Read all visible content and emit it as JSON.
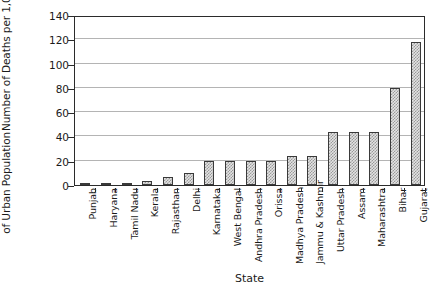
{
  "chart_data": {
    "type": "bar",
    "title": "",
    "xlabel": "State",
    "ylabel": "Number of Deaths per 1,000,000 of Urban Population",
    "ylabel_lines": [
      "Number of Deaths per 1,000,000",
      "of Urban Population"
    ],
    "categories": [
      "Punjab",
      "Haryana",
      "Tamil Nadu",
      "Kerala",
      "Rajasthan",
      "Delhi",
      "Karnataka",
      "West Bengal",
      "Andhra Pradesh",
      "Orissa",
      "Madhya Pradesh",
      "Jammu & Kashmir",
      "Uttar Pradesh",
      "Assam",
      "Maharashtra",
      "Bihar",
      "Gujarat"
    ],
    "values": [
      0.5,
      1,
      1.5,
      3,
      7,
      10,
      20,
      20,
      20,
      20,
      24,
      24,
      44,
      44,
      44,
      80,
      118
    ],
    "ylim": [
      0,
      140
    ],
    "yticks": [
      0,
      20,
      40,
      60,
      80,
      100,
      120,
      140
    ],
    "ytick_labels": [
      "0",
      "20",
      "40",
      "60",
      "80",
      "100",
      "120",
      "140"
    ],
    "grid": "horizontal",
    "legend": "none",
    "bar_fill": "#e3e3e3",
    "bar_pattern": "dotted-grey",
    "bar_edge_color": "#3a3a3a",
    "gridline_color": "#b4b4b4",
    "axis_color": "#2b2b2b"
  }
}
